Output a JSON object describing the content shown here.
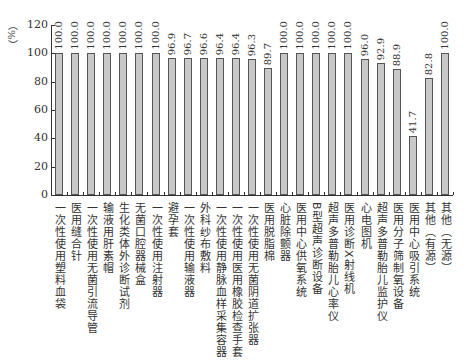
{
  "chart_data": {
    "type": "bar",
    "title": "",
    "xlabel": "",
    "ylabel": "（%）",
    "ylim": [
      0,
      120
    ],
    "yticks": [
      0,
      20,
      40,
      60,
      80,
      100,
      120
    ],
    "grid": false,
    "legend": null,
    "bar_color": "#c8c8c8",
    "bar_edge_color": "#555555",
    "categories": [
      "一次性使用塑料血袋",
      "医用缝合针",
      "一次性使用无菌引流导管",
      "输液用肝素帽",
      "生化类体外诊断试剂",
      "无菌口腔器械盒",
      "一次性使用注射器",
      "避孕套",
      "一次性使用输液器",
      "外科纱布敷料",
      "一次性使用静脉血样采集容器",
      "一次性使用医用橡胶检查手套",
      "一次性使用无菌阴道扩张器",
      "医用脱脂棉",
      "心脏除颤器",
      "医用中心供氧系统",
      "B型超声诊断设备",
      "超声多普勒胎儿心率仪",
      "医用诊断X射线机",
      "心电图机",
      "超声多普勒胎儿监护仪",
      "医用分子筛制氧设备",
      "医用中心吸引系统",
      "其他（有源）",
      "其他（无源）"
    ],
    "values": [
      100.0,
      100.0,
      100.0,
      100.0,
      100.0,
      100.0,
      100.0,
      96.9,
      96.7,
      96.6,
      96.4,
      96.4,
      96.3,
      89.7,
      100.0,
      100.0,
      100.0,
      100.0,
      100.0,
      96.0,
      92.9,
      88.9,
      41.7,
      82.8,
      100.0
    ],
    "value_labels": [
      "100.0",
      "100.0",
      "100.0",
      "100.0",
      "100.0",
      "100.0",
      "100.0",
      "96.9",
      "96.7",
      "96.6",
      "96.4",
      "96.4",
      "96.3",
      "89.7",
      "100.0",
      "100.0",
      "100.0",
      "100.0",
      "100.0",
      "96.0",
      "92.9",
      "88.9",
      "41.7",
      "82.8",
      "100.0"
    ]
  }
}
